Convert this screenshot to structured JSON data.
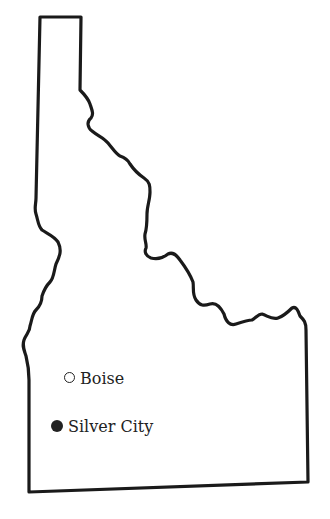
{
  "map": {
    "region": "Idaho",
    "outline_color": "#1a1a1a",
    "background": "#ffffff"
  },
  "places": [
    {
      "name": "Boise",
      "marker": "open-circle-icon"
    },
    {
      "name": "Silver City",
      "marker": "filled-circle-icon"
    }
  ]
}
